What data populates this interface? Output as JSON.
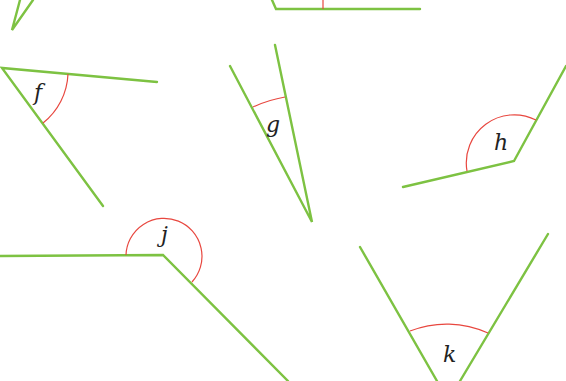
{
  "diagram": {
    "type": "angles",
    "colors": {
      "ray": "#7dc242",
      "arc": "#e8473f",
      "label": "#222222"
    },
    "angles": [
      {
        "label": "",
        "vertex": [
          12,
          30
        ]
      },
      {
        "label": "",
        "vertex": [
          276,
          9
        ]
      },
      {
        "label": "f",
        "vertex": [
          2,
          68
        ]
      },
      {
        "label": "g",
        "vertex": [
          312,
          222
        ]
      },
      {
        "label": "h",
        "vertex": [
          514,
          161
        ]
      },
      {
        "label": "j",
        "vertex": [
          163,
          255
        ]
      },
      {
        "label": "k",
        "vertex": [
          448,
          381
        ]
      }
    ]
  }
}
